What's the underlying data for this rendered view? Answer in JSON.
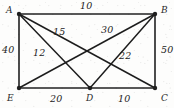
{
  "diagram": {
    "type": "weighted-graph",
    "style": "hand-drawn",
    "stroke_color": "#1f1f1f",
    "paper_color": "#fdfdfc",
    "vertices": [
      {
        "id": "A",
        "label": "A",
        "x": 19,
        "y": 14,
        "label_x": 6,
        "label_y": 6
      },
      {
        "id": "B",
        "label": "B",
        "x": 155,
        "y": 14,
        "label_x": 161,
        "label_y": 6
      },
      {
        "id": "C",
        "label": "C",
        "x": 155,
        "y": 88,
        "label_x": 161,
        "label_y": 94
      },
      {
        "id": "D",
        "label": "D",
        "x": 90,
        "y": 88,
        "label_x": 86,
        "label_y": 94
      },
      {
        "id": "E",
        "label": "E",
        "x": 19,
        "y": 88,
        "label_x": 7,
        "label_y": 94
      }
    ],
    "edges": [
      {
        "id": "AB",
        "from": "A",
        "to": "B",
        "weight": "10",
        "label_x": 80,
        "label_y": 1
      },
      {
        "id": "AE",
        "from": "A",
        "to": "E",
        "weight": "40",
        "label_x": 2,
        "label_y": 45
      },
      {
        "id": "BC",
        "from": "B",
        "to": "C",
        "weight": "50",
        "label_x": 161,
        "label_y": 45
      },
      {
        "id": "ED",
        "from": "E",
        "to": "D",
        "weight": "20",
        "label_x": 50,
        "label_y": 94
      },
      {
        "id": "DC",
        "from": "D",
        "to": "C",
        "weight": "10",
        "label_x": 118,
        "label_y": 94
      },
      {
        "id": "AC",
        "from": "A",
        "to": "C",
        "weight": "15",
        "label_x": 53,
        "label_y": 27
      },
      {
        "id": "AD",
        "from": "A",
        "to": "D",
        "weight": "12",
        "label_x": 33,
        "label_y": 48
      },
      {
        "id": "EB",
        "from": "E",
        "to": "B",
        "weight": "30",
        "label_x": 101,
        "label_y": 25
      },
      {
        "id": "DB",
        "from": "D",
        "to": "B",
        "weight": "22",
        "label_x": 119,
        "label_y": 51
      }
    ]
  }
}
